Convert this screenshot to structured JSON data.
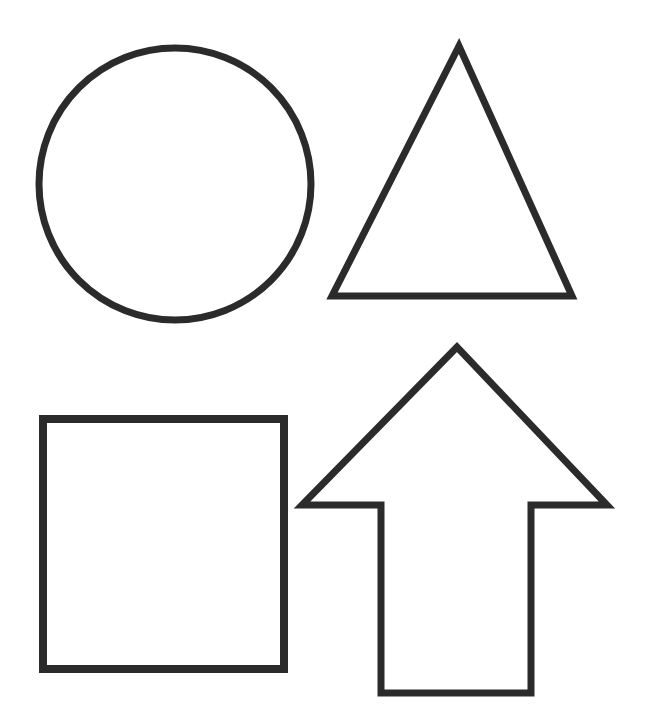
{
  "diagram": {
    "background": "#ffffff",
    "stroke_color": "#2b2b2b",
    "shapes": [
      {
        "id": "circle",
        "type": "circle",
        "label": "circle",
        "cx": 175,
        "cy": 184,
        "r": 136,
        "stroke_width": 7
      },
      {
        "id": "triangle",
        "type": "polygon",
        "label": "triangle",
        "points": "459,46 332,296 572,296",
        "stroke_width": 7
      },
      {
        "id": "square",
        "type": "rect",
        "label": "square",
        "x": 43,
        "y": 419,
        "width": 241,
        "height": 250,
        "stroke_width": 8
      },
      {
        "id": "arrow-up",
        "type": "polygon",
        "label": "up arrow",
        "points": "457,347 302,505 381,505 381,693 531,693 531,505 607,505",
        "stroke_width": 7
      }
    ]
  }
}
